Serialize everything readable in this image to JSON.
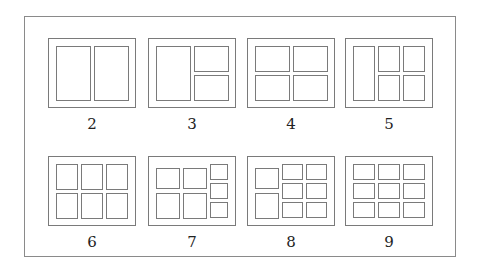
{
  "figure": {
    "layouts": [
      {
        "label": "2",
        "cells": [
          [
            0,
            0,
            0.5,
            1
          ],
          [
            0.5,
            0,
            0.5,
            1
          ]
        ]
      },
      {
        "label": "3",
        "cells": [
          [
            0,
            0,
            0.5,
            1
          ],
          [
            0.5,
            0,
            0.5,
            0.5
          ],
          [
            0.5,
            0.5,
            0.5,
            0.5
          ]
        ]
      },
      {
        "label": "4",
        "cells": [
          [
            0,
            0,
            0.5,
            0.5
          ],
          [
            0.5,
            0,
            0.5,
            0.5
          ],
          [
            0,
            0.5,
            0.5,
            0.5
          ],
          [
            0.5,
            0.5,
            0.5,
            0.5
          ]
        ]
      },
      {
        "label": "5",
        "cells": [
          [
            0,
            0,
            0.3333,
            1
          ],
          [
            0.3333,
            0,
            0.3333,
            0.5
          ],
          [
            0.6667,
            0,
            0.3333,
            0.5
          ],
          [
            0.3333,
            0.5,
            0.3333,
            0.5
          ],
          [
            0.6667,
            0.5,
            0.3333,
            0.5
          ]
        ]
      },
      {
        "label": "6",
        "cells": [
          [
            0,
            0,
            0.3333,
            0.5
          ],
          [
            0.3333,
            0,
            0.3333,
            0.5
          ],
          [
            0.6667,
            0,
            0.3333,
            0.5
          ],
          [
            0,
            0.5,
            0.3333,
            0.5
          ],
          [
            0.3333,
            0.5,
            0.3333,
            0.5
          ],
          [
            0.6667,
            0.5,
            0.3333,
            0.5
          ]
        ]
      },
      {
        "label": "7",
        "cells": [
          [
            0,
            0.07,
            0.36,
            0.43
          ],
          [
            0.36,
            0.07,
            0.36,
            0.43
          ],
          [
            0,
            0.5,
            0.36,
            0.5
          ],
          [
            0.36,
            0.5,
            0.36,
            0.5
          ],
          [
            0.72,
            0,
            0.28,
            0.3333
          ],
          [
            0.72,
            0.3333,
            0.28,
            0.3333
          ],
          [
            0.72,
            0.6667,
            0.28,
            0.3333
          ]
        ]
      },
      {
        "label": "8",
        "cells": [
          [
            0,
            0.07,
            0.36,
            0.43
          ],
          [
            0,
            0.5,
            0.36,
            0.5
          ],
          [
            0.36,
            0,
            0.32,
            0.3333
          ],
          [
            0.68,
            0,
            0.32,
            0.3333
          ],
          [
            0.36,
            0.3333,
            0.32,
            0.3333
          ],
          [
            0.68,
            0.3333,
            0.32,
            0.3333
          ],
          [
            0.36,
            0.6667,
            0.32,
            0.3333
          ],
          [
            0.68,
            0.6667,
            0.32,
            0.3333
          ]
        ]
      },
      {
        "label": "9",
        "cells": [
          [
            0,
            0,
            0.3333,
            0.3333
          ],
          [
            0.3333,
            0,
            0.3333,
            0.3333
          ],
          [
            0.6667,
            0,
            0.3333,
            0.3333
          ],
          [
            0,
            0.3333,
            0.3333,
            0.3333
          ],
          [
            0.3333,
            0.3333,
            0.3333,
            0.3333
          ],
          [
            0.6667,
            0.3333,
            0.3333,
            0.3333
          ],
          [
            0,
            0.6667,
            0.3333,
            0.3333
          ],
          [
            0.3333,
            0.6667,
            0.3333,
            0.3333
          ],
          [
            0.6667,
            0.6667,
            0.3333,
            0.3333
          ]
        ]
      }
    ]
  },
  "colors": {
    "line": "#7a7a7a",
    "frame": "#8a8a8a",
    "text": "#222222"
  }
}
